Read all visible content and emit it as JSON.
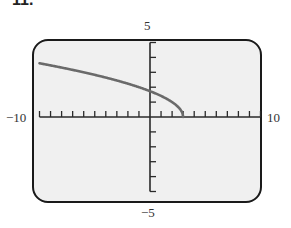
{
  "header": {
    "problem_number": "11."
  },
  "colors": {
    "screen_bg": "#f0f0f0",
    "frame": "#1a1a1a",
    "axis": "#2a2a2a",
    "curve": "#6a6a6a"
  },
  "labels": {
    "x_min": "−10",
    "x_max": "10",
    "y_max": "5",
    "y_min": "−5"
  },
  "chart_data": {
    "type": "line",
    "title": "",
    "xlabel": "",
    "ylabel": "",
    "xlim": [
      -10,
      10
    ],
    "ylim": [
      -5,
      5
    ],
    "x_ticks_step": 1,
    "y_ticks_step": 1,
    "grid": false,
    "legend": null,
    "series": [
      {
        "name": "y = sqrt(3 - x)",
        "x": [
          -10,
          -8,
          -6,
          -4,
          -2,
          0,
          1,
          2,
          2.5,
          2.8,
          3
        ],
        "y": [
          3.61,
          3.32,
          3.0,
          2.65,
          2.24,
          1.73,
          1.41,
          1.0,
          0.71,
          0.45,
          0
        ]
      }
    ],
    "annotations": []
  }
}
